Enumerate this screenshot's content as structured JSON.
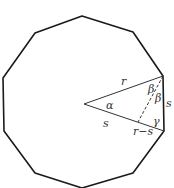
{
  "figure": {
    "shape": "regular decagon",
    "stroke_color": "#1a1a1a",
    "label_color": "#333333",
    "labels": {
      "r": "r",
      "alpha": "α",
      "beta_1": "β",
      "beta_2": "β",
      "s_side": "s",
      "gamma": "γ",
      "s_radius": "s",
      "r_minus_s": "r−s"
    }
  }
}
